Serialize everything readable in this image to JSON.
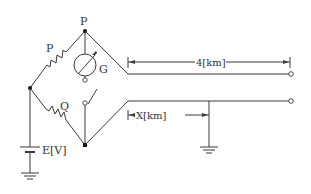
{
  "diagram": {
    "labels": {
      "node_top": "P",
      "resistor_p": "P",
      "resistor_q": "Q",
      "galvanometer": "G",
      "battery": "E[V]",
      "line_length": "4[km]",
      "fault_distance": "X[km]"
    },
    "colors": {
      "line": "#3a3a3a",
      "text": "#333333",
      "background": "#ffffff"
    }
  }
}
